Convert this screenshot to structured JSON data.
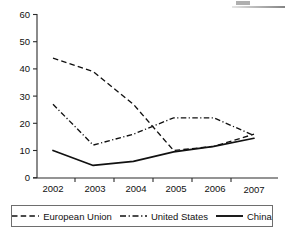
{
  "chart_data": {
    "type": "line",
    "title": "",
    "subtitle": "",
    "xlabel": "",
    "ylabel": "",
    "x": [
      "2002",
      "2003",
      "2004",
      "2005",
      "2006",
      "2007"
    ],
    "categories": [
      "2002",
      "2003",
      "2004",
      "2005",
      "2006",
      "2007"
    ],
    "series": [
      {
        "name": "European Union",
        "values": [
          44,
          39,
          27,
          10,
          11.5,
          16
        ],
        "style": "dashed"
      },
      {
        "name": "United States",
        "values": [
          27,
          12,
          16,
          22,
          22,
          15.5
        ],
        "style": "dash-dot"
      },
      {
        "name": "China",
        "values": [
          10,
          4.5,
          6,
          9.5,
          11.5,
          14.5
        ],
        "style": "solid"
      }
    ],
    "ylim": [
      0,
      60
    ],
    "ytick_values": [
      "0",
      "10",
      "20",
      "30",
      "40",
      "50",
      "60"
    ],
    "xtick_values": [
      "2002",
      "2003",
      "2004",
      "2005",
      "2006",
      "2007"
    ],
    "grid": false,
    "legend_position": "bottom",
    "line_color": "#111111",
    "axis_color": "#2b2b2b",
    "background": "#ffffff"
  },
  "axis": {
    "y_ticks": [
      {
        "label": "60",
        "value": 60
      },
      {
        "label": "50",
        "value": 50
      },
      {
        "label": "40",
        "value": 40
      },
      {
        "label": "30",
        "value": 30
      },
      {
        "label": "20",
        "value": 20
      },
      {
        "label": "10",
        "value": 10
      },
      {
        "label": "0",
        "value": 0
      }
    ],
    "x_ticks": [
      {
        "label": "2002"
      },
      {
        "label": "2003"
      },
      {
        "label": "2004"
      },
      {
        "label": "2005"
      },
      {
        "label": "2006"
      },
      {
        "label": "2007"
      }
    ]
  },
  "legend": {
    "items": [
      {
        "label": "European Union",
        "style": "dashed",
        "icon": "dashed-line-icon"
      },
      {
        "label": "United States",
        "style": "dash-dot",
        "icon": "dash-dot-line-icon"
      },
      {
        "label": "China",
        "style": "solid",
        "icon": "solid-line-icon"
      }
    ]
  }
}
